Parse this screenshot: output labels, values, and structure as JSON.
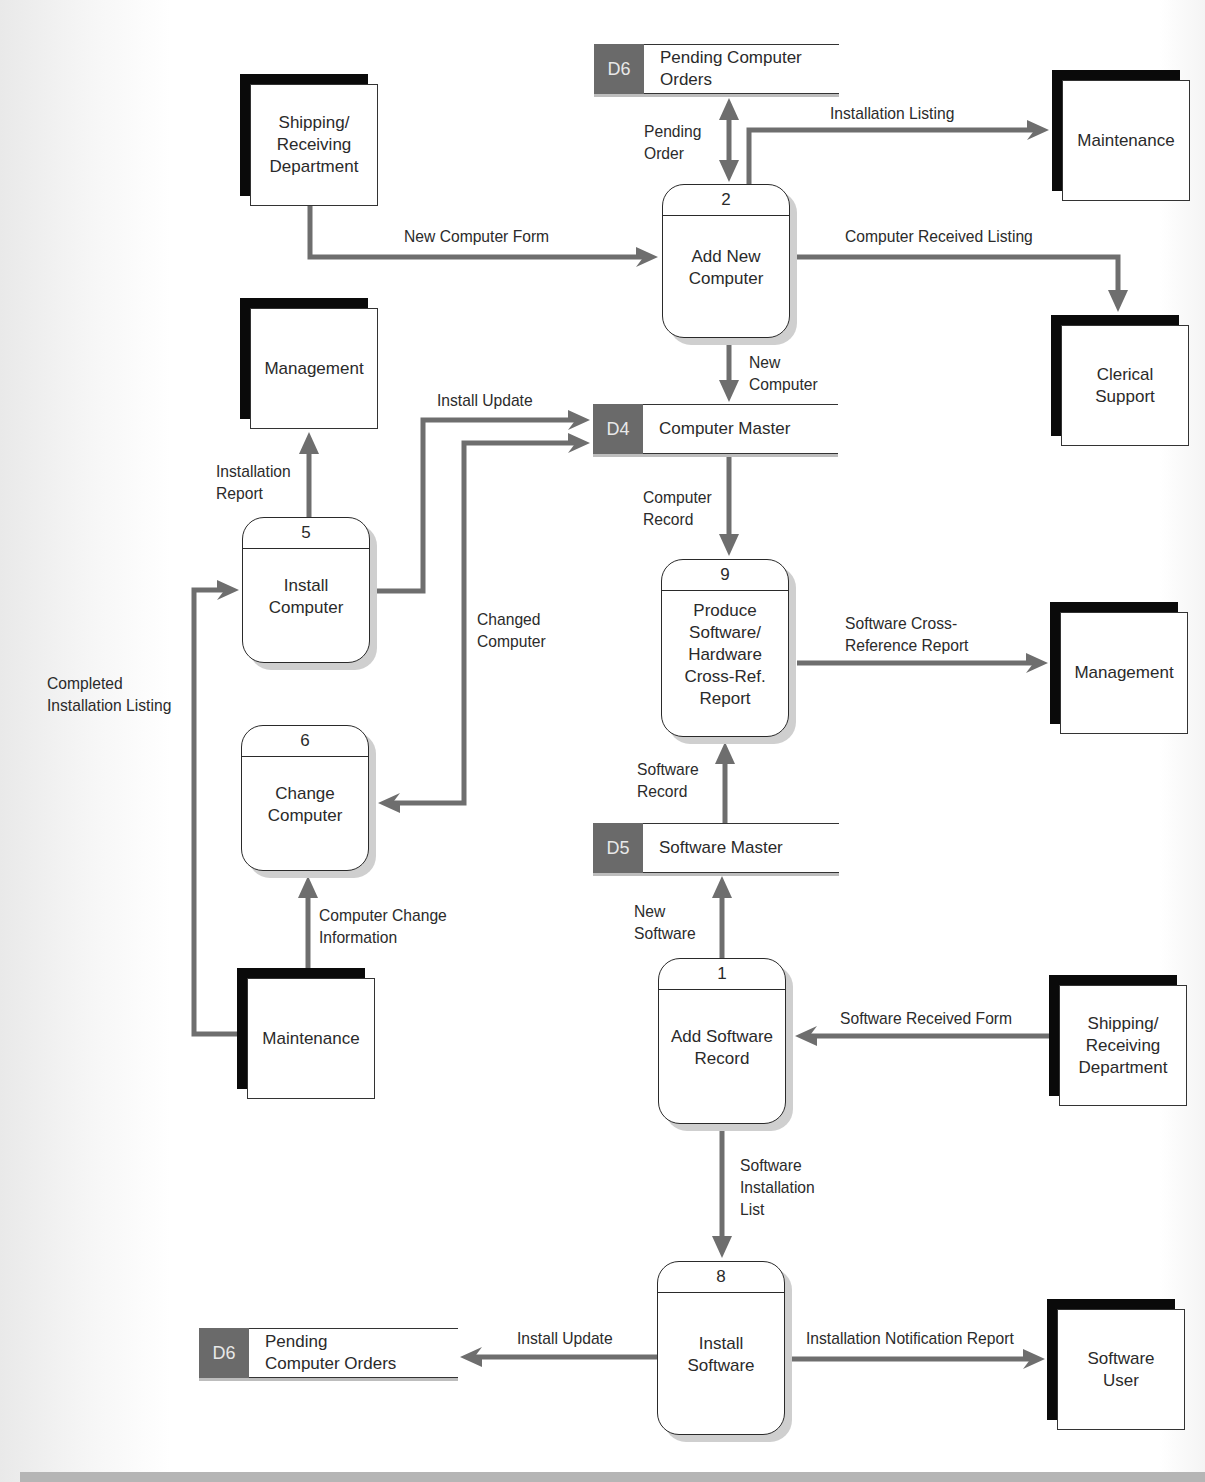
{
  "colors": {
    "flow": "#6e6e6e",
    "entity_shadow": "#0a0a0a",
    "store_id_bg": "#6a6a6a",
    "process_border": "#2a2a2a"
  },
  "external_entities": [
    {
      "id": "ee-shipping-top",
      "label": "Shipping/\nReceiving\nDepartment",
      "x": 240,
      "y": 74,
      "w": 138,
      "h": 132
    },
    {
      "id": "ee-maintenance-top",
      "label": "Maintenance",
      "x": 1052,
      "y": 70,
      "w": 138,
      "h": 131
    },
    {
      "id": "ee-management-left",
      "label": "Management",
      "x": 240,
      "y": 298,
      "w": 138,
      "h": 131
    },
    {
      "id": "ee-clerical-support",
      "label": "Clerical\nSupport",
      "x": 1051,
      "y": 315,
      "w": 138,
      "h": 131
    },
    {
      "id": "ee-management-right",
      "label": "Management",
      "x": 1050,
      "y": 602,
      "w": 138,
      "h": 132
    },
    {
      "id": "ee-maintenance-bottom",
      "label": "Maintenance",
      "x": 237,
      "y": 968,
      "w": 138,
      "h": 131
    },
    {
      "id": "ee-shipping-bottom",
      "label": "Shipping/\nReceiving\nDepartment",
      "x": 1049,
      "y": 975,
      "w": 138,
      "h": 131
    },
    {
      "id": "ee-software-user",
      "label": "Software\nUser",
      "x": 1047,
      "y": 1299,
      "w": 138,
      "h": 131
    }
  ],
  "processes": [
    {
      "id": "2",
      "label": "Add New\nComputer",
      "x": 662,
      "y": 184,
      "w": 128,
      "h": 154
    },
    {
      "id": "5",
      "label": "Install\nComputer",
      "x": 242,
      "y": 517,
      "w": 128,
      "h": 146
    },
    {
      "id": "9",
      "label": "Produce\nSoftware/\nHardware\nCross-Ref.\nReport",
      "x": 661,
      "y": 559,
      "w": 128,
      "h": 178
    },
    {
      "id": "6",
      "label": "Change\nComputer",
      "x": 241,
      "y": 725,
      "w": 128,
      "h": 146
    },
    {
      "id": "1",
      "label": "Add Software\nRecord",
      "x": 658,
      "y": 958,
      "w": 128,
      "h": 166
    },
    {
      "id": "8",
      "label": "Install\nSoftware",
      "x": 657,
      "y": 1261,
      "w": 128,
      "h": 174
    }
  ],
  "data_stores": [
    {
      "id": "D6",
      "label": "Pending Computer\nOrders",
      "x": 594,
      "y": 44,
      "w": 245
    },
    {
      "id": "D4",
      "label": "Computer Master",
      "x": 593,
      "y": 404,
      "w": 245
    },
    {
      "id": "D5",
      "label": "Software Master",
      "x": 593,
      "y": 823,
      "w": 246
    },
    {
      "id": "D6",
      "label": "Pending\nComputer Orders",
      "x": 199,
      "y": 1328,
      "w": 259
    }
  ],
  "flows": [
    {
      "name": "new-computer-form",
      "label": "New Computer Form",
      "lx": 404,
      "ly": 226,
      "points": [
        [
          310,
          206
        ],
        [
          310,
          257
        ],
        [
          658,
          257
        ]
      ],
      "arrow_end": true,
      "arrow_start": false
    },
    {
      "name": "pending-order",
      "label": "Pending\nOrder",
      "lx": 644,
      "ly": 121,
      "points": [
        [
          729,
          98
        ],
        [
          729,
          182
        ]
      ],
      "arrow_end": true,
      "arrow_start": true
    },
    {
      "name": "installation-listing",
      "label": "Installation Listing",
      "lx": 830,
      "ly": 103,
      "points": [
        [
          749,
          184
        ],
        [
          749,
          130
        ],
        [
          1049,
          130
        ]
      ],
      "arrow_end": true,
      "arrow_start": false
    },
    {
      "name": "computer-received-listing",
      "label": "Computer Received Listing",
      "lx": 845,
      "ly": 226,
      "points": [
        [
          790,
          257
        ],
        [
          1118,
          257
        ],
        [
          1118,
          312
        ]
      ],
      "arrow_end": true,
      "arrow_start": false
    },
    {
      "name": "new-computer",
      "label": "New\nComputer",
      "lx": 749,
      "ly": 352,
      "points": [
        [
          729,
          338
        ],
        [
          729,
          402
        ]
      ],
      "arrow_end": true,
      "arrow_start": false
    },
    {
      "name": "install-update-top",
      "label": "Install Update",
      "lx": 437,
      "ly": 390,
      "points": [
        [
          370,
          591
        ],
        [
          423,
          591
        ],
        [
          423,
          420
        ],
        [
          590,
          420
        ]
      ],
      "arrow_end": true,
      "arrow_start": false
    },
    {
      "name": "changed-computer",
      "label": "Changed\nComputer",
      "lx": 477,
      "ly": 609,
      "points": [
        [
          378,
          803
        ],
        [
          464,
          803
        ],
        [
          464,
          443
        ],
        [
          590,
          443
        ]
      ],
      "arrow_end": true,
      "arrow_start": true
    },
    {
      "name": "installation-report",
      "label": "Installation\nReport",
      "lx": 216,
      "ly": 461,
      "points": [
        [
          309,
          517
        ],
        [
          309,
          432
        ]
      ],
      "arrow_end": true,
      "arrow_start": false
    },
    {
      "name": "computer-record",
      "label": "Computer\nRecord",
      "lx": 643,
      "ly": 487,
      "points": [
        [
          729,
          456
        ],
        [
          729,
          556
        ]
      ],
      "arrow_end": true,
      "arrow_start": false
    },
    {
      "name": "software-cross-reference-report",
      "label": "Software Cross-\nReference Report",
      "lx": 845,
      "ly": 613,
      "points": [
        [
          797,
          663
        ],
        [
          1048,
          663
        ]
      ],
      "arrow_end": true,
      "arrow_start": false
    },
    {
      "name": "completed-installation-listing",
      "label": "Completed\nInstallation Listing",
      "lx": 47,
      "ly": 673,
      "points": [
        [
          237,
          1034
        ],
        [
          194,
          1034
        ],
        [
          194,
          590
        ],
        [
          239,
          590
        ]
      ],
      "arrow_end": true,
      "arrow_start": false
    },
    {
      "name": "computer-change-information",
      "label": "Computer Change\nInformation",
      "lx": 319,
      "ly": 905,
      "points": [
        [
          308,
          968
        ],
        [
          308,
          876
        ]
      ],
      "arrow_end": true,
      "arrow_start": false
    },
    {
      "name": "software-record",
      "label": "Software\nRecord",
      "lx": 637,
      "ly": 759,
      "points": [
        [
          725,
          823
        ],
        [
          725,
          742
        ]
      ],
      "arrow_end": true,
      "arrow_start": false
    },
    {
      "name": "new-software",
      "label": "New\nSoftware",
      "lx": 634,
      "ly": 901,
      "points": [
        [
          722,
          958
        ],
        [
          722,
          876
        ]
      ],
      "arrow_end": true,
      "arrow_start": false
    },
    {
      "name": "software-received-form",
      "label": "Software Received Form",
      "lx": 840,
      "ly": 1008,
      "points": [
        [
          1049,
          1036
        ],
        [
          795,
          1036
        ]
      ],
      "arrow_end": true,
      "arrow_start": false
    },
    {
      "name": "software-installation-list",
      "label": "Software\nInstallation\nList",
      "lx": 740,
      "ly": 1155,
      "points": [
        [
          722,
          1126
        ],
        [
          722,
          1258
        ]
      ],
      "arrow_end": true,
      "arrow_start": false
    },
    {
      "name": "install-update-bottom",
      "label": "Install Update",
      "lx": 517,
      "ly": 1328,
      "points": [
        [
          657,
          1357
        ],
        [
          460,
          1357
        ]
      ],
      "arrow_end": true,
      "arrow_start": false
    },
    {
      "name": "installation-notification-report",
      "label": "Installation Notification Report",
      "lx": 806,
      "ly": 1328,
      "points": [
        [
          792,
          1359
        ],
        [
          1045,
          1359
        ]
      ],
      "arrow_end": true,
      "arrow_start": false
    }
  ]
}
